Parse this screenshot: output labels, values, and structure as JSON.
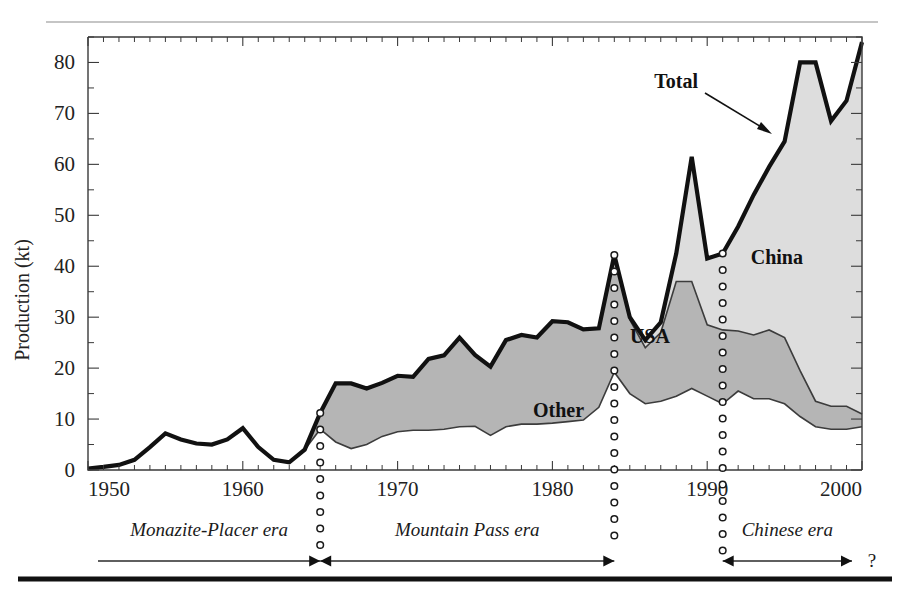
{
  "figure": {
    "background_color": "#ffffff",
    "rules": {
      "top_rule_color": "#8c8c8c",
      "bottom_rule_color": "#111111"
    }
  },
  "chart_data": {
    "type": "area",
    "title": "",
    "subtitle": "",
    "xlabel": "",
    "ylabel": "Production (kt)",
    "xlim": [
      1950,
      2000
    ],
    "ylim": [
      0,
      85
    ],
    "xticks": [
      1950,
      1960,
      1970,
      1980,
      1990,
      2000
    ],
    "xtick_labels": [
      "1950",
      "1960",
      "1970",
      "1980",
      "1990",
      "2000"
    ],
    "x_minor_tick_step": 1,
    "yticks": [
      0,
      10,
      20,
      30,
      40,
      50,
      60,
      70,
      80
    ],
    "ytick_labels": [
      "0",
      "10",
      "20",
      "30",
      "40",
      "50",
      "60",
      "70",
      "80"
    ],
    "y_minor_tick_step": 5,
    "grid": false,
    "legend_position": "inline-annotations",
    "stacking": "stacked",
    "x": [
      1950,
      1951,
      1952,
      1953,
      1954,
      1955,
      1956,
      1957,
      1958,
      1959,
      1960,
      1961,
      1962,
      1963,
      1964,
      1965,
      1966,
      1967,
      1968,
      1969,
      1970,
      1971,
      1972,
      1973,
      1974,
      1975,
      1976,
      1977,
      1978,
      1979,
      1980,
      1981,
      1982,
      1983,
      1984,
      1985,
      1986,
      1987,
      1988,
      1989,
      1990,
      1991,
      1992,
      1993,
      1994,
      1995,
      1996,
      1997,
      1998,
      1999,
      2000
    ],
    "series": [
      {
        "name": "Other",
        "label": "Other",
        "fill_color": "#ffffff",
        "values": [
          0.3,
          0.6,
          1.0,
          2.0,
          4.5,
          7.2,
          6.0,
          5.2,
          5.0,
          6.0,
          8.2,
          4.5,
          2.0,
          1.5,
          4.0,
          8.0,
          5.5,
          4.2,
          5.0,
          6.6,
          7.5,
          7.8,
          7.8,
          8.0,
          8.5,
          8.6,
          6.8,
          8.5,
          9.0,
          9.0,
          9.2,
          9.5,
          9.8,
          12.3,
          19.2,
          15.0,
          13.0,
          13.5,
          14.5,
          16.0,
          14.5,
          13.0,
          15.5,
          14.0,
          14.0,
          13.0,
          10.5,
          8.5,
          8.0,
          8.0,
          8.5
        ]
      },
      {
        "name": "USA",
        "label": "USA",
        "fill_color": "#b5b5b5",
        "values": [
          0.0,
          0.0,
          0.0,
          0.0,
          0.0,
          0.0,
          0.0,
          0.0,
          0.0,
          0.0,
          0.0,
          0.0,
          0.0,
          0.0,
          0.0,
          3.2,
          11.5,
          12.8,
          11.0,
          10.5,
          11.0,
          10.5,
          14.0,
          14.5,
          17.5,
          14.0,
          13.5,
          17.0,
          17.5,
          17.0,
          20.0,
          19.5,
          17.8,
          15.5,
          23.0,
          14.5,
          11.0,
          13.5,
          22.5,
          21.0,
          14.0,
          14.5,
          11.8,
          12.5,
          13.5,
          13.0,
          9.0,
          5.0,
          4.5,
          4.5,
          2.5
        ]
      },
      {
        "name": "China",
        "label": "China",
        "fill_color": "#dddddd",
        "values": [
          0.0,
          0.0,
          0.0,
          0.0,
          0.0,
          0.0,
          0.0,
          0.0,
          0.0,
          0.0,
          0.0,
          0.0,
          0.0,
          0.0,
          0.0,
          0.0,
          0.0,
          0.0,
          0.0,
          0.0,
          0.0,
          0.0,
          0.0,
          0.0,
          0.0,
          0.0,
          0.0,
          0.0,
          0.0,
          0.0,
          0.0,
          0.0,
          0.0,
          0.0,
          0.0,
          0.5,
          1.5,
          2.0,
          5.5,
          24.5,
          13.0,
          15.0,
          20.5,
          27.5,
          32.0,
          38.5,
          60.5,
          66.5,
          56.0,
          60.0,
          73.0
        ]
      }
    ],
    "total": {
      "name": "Total",
      "label": "Total",
      "line_color": "#111111",
      "values": [
        0.3,
        0.6,
        1.0,
        2.0,
        4.5,
        7.2,
        6.0,
        5.2,
        5.0,
        6.0,
        8.2,
        4.5,
        2.0,
        1.5,
        4.0,
        11.2,
        17.0,
        17.0,
        16.0,
        17.1,
        18.5,
        18.3,
        21.8,
        22.5,
        26.0,
        22.6,
        20.3,
        25.5,
        26.5,
        26.0,
        29.2,
        29.0,
        27.6,
        27.8,
        42.2,
        30.0,
        25.5,
        29.0,
        42.5,
        61.5,
        41.5,
        42.5,
        47.8,
        54.0,
        59.5,
        64.5,
        80.0,
        80.0,
        68.5,
        72.5,
        84.0
      ]
    },
    "annotations": [
      {
        "name": "total-callout",
        "text": "Total",
        "x": 1988.0,
        "y": 75.0
      },
      {
        "name": "china-region-label",
        "text": "China",
        "x": 1994.5,
        "y": 40.5
      },
      {
        "name": "usa-region-label",
        "text": "USA",
        "x": 1986.3,
        "y": 25.0
      },
      {
        "name": "other-region-label",
        "text": "Other",
        "x": 1980.4,
        "y": 10.5
      }
    ],
    "dotted_markers_x": [
      1965,
      1984,
      1991
    ],
    "eras": [
      {
        "name": "monazite-placer-era",
        "label": "Monazite-Placer era",
        "start": 1950,
        "end": 1965
      },
      {
        "name": "mountain-pass-era",
        "label": "Mountain Pass era",
        "start": 1965,
        "end": 1984
      },
      {
        "name": "chinese-era",
        "label": "Chinese era",
        "start": 1991,
        "end": 2000
      }
    ],
    "era_trailing_mark": "?"
  }
}
